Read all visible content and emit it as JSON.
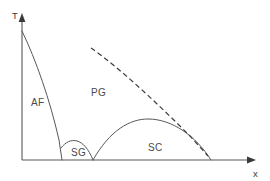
{
  "figure": {
    "title": "",
    "background_color": "#ffffff",
    "line_color": "#58585a"
  },
  "axes": {
    "y_label": "T",
    "x_label": "x",
    "origin": {
      "x": 22,
      "y": 160
    },
    "y_axis_top": {
      "x": 22,
      "y": 14
    },
    "x_axis_right": {
      "x": 256,
      "y": 160
    },
    "y_label_pos": {
      "x": 12,
      "y": 16
    },
    "x_label_pos": {
      "x": 255,
      "y": 176
    }
  },
  "regions": [
    {
      "key": "af",
      "label": "AF",
      "name": "antiferromagnetic",
      "label_pos": {
        "x": 38,
        "y": 103
      }
    },
    {
      "key": "pg",
      "label": "PG",
      "name": "pseudogap",
      "label_pos": {
        "x": 98,
        "y": 93
      }
    },
    {
      "key": "sg",
      "label": "SG",
      "name": "spin-glass",
      "label_pos": {
        "x": 78,
        "y": 153
      }
    },
    {
      "key": "sc",
      "label": "SC",
      "name": "superconducting",
      "label_pos": {
        "x": 155,
        "y": 148
      }
    }
  ],
  "chart_data": {
    "type": "line",
    "title": "",
    "xlabel": "x",
    "ylabel": "T",
    "grid": false,
    "legend": "none",
    "xlim": [
      0,
      1
    ],
    "ylim": [
      0,
      1
    ],
    "series": [
      {
        "name": "AF boundary",
        "style": "solid",
        "path": "M 22,31 C 36,60 50,100 59,140 L 62,160"
      },
      {
        "name": "SG dome",
        "style": "solid",
        "path": "M 61,148 C 70,136 84,137 93,160"
      },
      {
        "name": "SC dome",
        "style": "solid",
        "path": "M 93,160 C 110,130 130,119 148,119 C 172,119 196,136 211,160"
      },
      {
        "name": "Pseudogap T* line",
        "style": "dashed",
        "path": "M 91,48 C 120,68 160,106 190,136 L 208,156"
      }
    ]
  }
}
